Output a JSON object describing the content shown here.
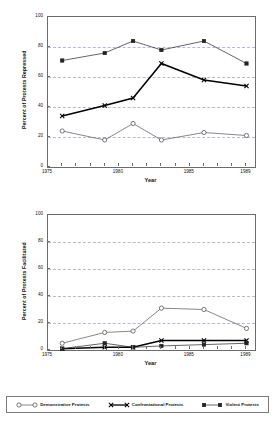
{
  "figure": {
    "legend": {
      "entries": [
        {
          "label": "Demonstrative Protests",
          "marker": "open-circle",
          "color": "#555555"
        },
        {
          "label": "Confrontational Protests",
          "marker": "x-cross",
          "color": "#000000"
        },
        {
          "label": "Violent Protests",
          "marker": "filled-square",
          "color": "#222222"
        }
      ]
    }
  },
  "chart_data": [
    {
      "type": "line",
      "title": "",
      "xlabel": "Year",
      "ylabel": "Percent of Protests Repressed",
      "x": [
        1976,
        1979,
        1981,
        1983,
        1986,
        1989
      ],
      "xlim": [
        1975,
        1989.6
      ],
      "ylim": [
        0,
        100
      ],
      "yticks": [
        0,
        20,
        40,
        60,
        80,
        100
      ],
      "xticks": [
        1975,
        1980,
        1985,
        1989
      ],
      "xtick_labels": [
        "1975",
        "1980",
        "1985",
        "1989"
      ],
      "grid": "horizontal-dashed",
      "legend_position": "below-figure",
      "series": [
        {
          "name": "Demonstrative Protests",
          "marker": "open-circle",
          "color": "#555555",
          "values": [
            24,
            18,
            29,
            18,
            23,
            21
          ]
        },
        {
          "name": "Confrontational Protests",
          "marker": "x-cross",
          "color": "#000000",
          "values": [
            34,
            41,
            46,
            69,
            58,
            54
          ]
        },
        {
          "name": "Violent Protests",
          "marker": "filled-square",
          "color": "#222222",
          "values": [
            71,
            76,
            84,
            78,
            84,
            69
          ]
        }
      ]
    },
    {
      "type": "line",
      "title": "",
      "xlabel": "Year",
      "ylabel": "Percent of Protests Facilitated",
      "x": [
        1976,
        1979,
        1981,
        1983,
        1986,
        1989
      ],
      "xlim": [
        1975,
        1989.6
      ],
      "ylim": [
        0,
        100
      ],
      "yticks": [
        0,
        20,
        40,
        60,
        80,
        100
      ],
      "xticks": [
        1975,
        1980,
        1985,
        1989
      ],
      "xtick_labels": [
        "1975",
        "1980",
        "1985",
        "1989"
      ],
      "grid": "horizontal-dashed",
      "legend_position": "below-figure",
      "series": [
        {
          "name": "Demonstrative Protests",
          "marker": "open-circle",
          "color": "#555555",
          "values": [
            5,
            13,
            14,
            31,
            30,
            16
          ]
        },
        {
          "name": "Confrontational Protests",
          "marker": "x-cross",
          "color": "#000000",
          "values": [
            1,
            2,
            2,
            7,
            7,
            7
          ]
        },
        {
          "name": "Violent Protests",
          "marker": "filled-square",
          "color": "#222222",
          "values": [
            1,
            5,
            2,
            3,
            4,
            5
          ]
        }
      ]
    }
  ]
}
